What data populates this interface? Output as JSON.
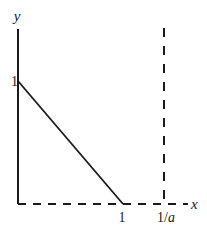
{
  "diagram": {
    "type": "line-plot",
    "axes": {
      "x_label": "x",
      "y_label": "y",
      "x_range": [
        0,
        1.3
      ],
      "y_range": [
        0,
        1.55
      ]
    },
    "ticks": {
      "y_one": "1",
      "x_one": "1",
      "x_inv_a_prefix": "1/",
      "x_inv_a_var": "a"
    },
    "line": {
      "from": [
        0,
        1
      ],
      "to": [
        1,
        0
      ],
      "style": "solid"
    },
    "vertical_asymptote": {
      "x_value": 1.3,
      "label": "1/a",
      "style": "dashed"
    },
    "x_axis_style": "dashed",
    "y_axis_style": "solid",
    "colors": {
      "ink": "#1a1a1a"
    }
  }
}
